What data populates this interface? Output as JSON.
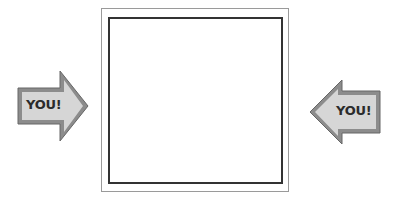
{
  "frame": {
    "outer_border_color": "#9a9a9a",
    "inner_border_color": "#333333"
  },
  "arrows": [
    {
      "label": "YOU!",
      "direction": "right",
      "fill": "#d4d4d4",
      "border": "#7a7a7a",
      "icon": "arrow-right-icon"
    },
    {
      "label": "YOU!",
      "direction": "left",
      "fill": "#d4d4d4",
      "border": "#7a7a7a",
      "icon": "arrow-left-icon"
    }
  ]
}
